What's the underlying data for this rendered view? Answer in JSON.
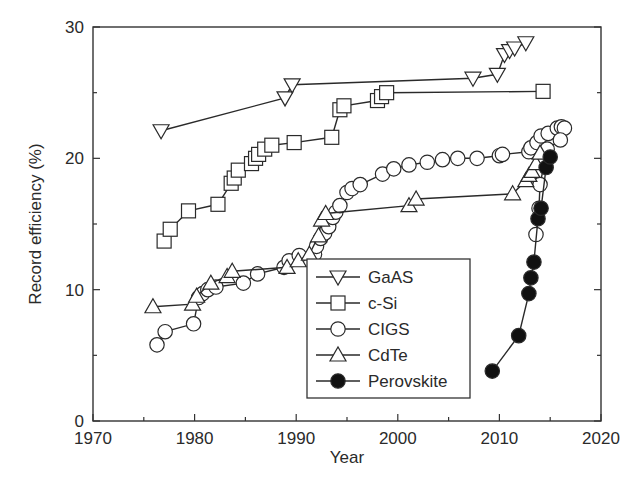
{
  "chart_data": {
    "type": "line",
    "title": "",
    "xlabel": "Year",
    "ylabel": "Record efficiency (%)",
    "xlim": [
      1970,
      2020
    ],
    "ylim": [
      0,
      30
    ],
    "x_ticks": [
      1970,
      1980,
      1990,
      2000,
      2010,
      2020
    ],
    "y_ticks": [
      0,
      10,
      20,
      30
    ],
    "x_minor_ticks": [
      1975,
      1985,
      1995,
      2005,
      2015
    ],
    "y_minor_ticks": [
      5,
      15,
      25
    ],
    "grid": false,
    "legend_position": "lower center (inside plot)",
    "series": [
      {
        "name": "GaAS",
        "marker": "triangle-down",
        "fill": "open",
        "points": [
          [
            1976.7,
            22.1
          ],
          [
            1988.9,
            24.6
          ],
          [
            1989.6,
            25.6
          ],
          [
            2007.4,
            26.1
          ],
          [
            2009.8,
            26.4
          ],
          [
            2010.5,
            27.9
          ],
          [
            2011.0,
            28.2
          ],
          [
            2011.5,
            28.4
          ],
          [
            2012.6,
            28.8
          ]
        ]
      },
      {
        "name": "c-Si",
        "marker": "square",
        "fill": "open",
        "points": [
          [
            1977.0,
            13.7
          ],
          [
            1977.6,
            14.6
          ],
          [
            1979.4,
            16.0
          ],
          [
            1982.3,
            16.5
          ],
          [
            1983.6,
            18.1
          ],
          [
            1983.9,
            18.5
          ],
          [
            1984.3,
            19.1
          ],
          [
            1985.6,
            19.6
          ],
          [
            1986.0,
            20.0
          ],
          [
            1986.3,
            20.3
          ],
          [
            1986.9,
            20.7
          ],
          [
            1987.6,
            21.0
          ],
          [
            1989.8,
            21.2
          ],
          [
            1993.5,
            21.6
          ],
          [
            1994.3,
            23.7
          ],
          [
            1994.7,
            24.0
          ],
          [
            1998.0,
            24.4
          ],
          [
            1998.4,
            24.7
          ],
          [
            1998.9,
            25.0
          ],
          [
            2014.3,
            25.1
          ]
        ]
      },
      {
        "name": "CIGS",
        "marker": "circle",
        "fill": "open",
        "points": [
          [
            1976.3,
            5.8
          ],
          [
            1977.1,
            6.8
          ],
          [
            1979.9,
            7.4
          ],
          [
            1980.4,
            9.4
          ],
          [
            1980.8,
            9.7
          ],
          [
            1981.3,
            10.0
          ],
          [
            1982.1,
            10.2
          ],
          [
            1984.8,
            10.5
          ],
          [
            1986.2,
            11.2
          ],
          [
            1988.8,
            11.7
          ],
          [
            1989.3,
            12.2
          ],
          [
            1990.3,
            12.6
          ],
          [
            1991.8,
            12.7
          ],
          [
            1992.0,
            13.3
          ],
          [
            1992.4,
            13.9
          ],
          [
            1992.8,
            14.3
          ],
          [
            1993.2,
            14.8
          ],
          [
            1993.6,
            15.5
          ],
          [
            1993.9,
            15.9
          ],
          [
            1994.3,
            16.4
          ],
          [
            1995.0,
            17.4
          ],
          [
            1995.5,
            17.7
          ],
          [
            1996.3,
            18.0
          ],
          [
            1998.5,
            18.8
          ],
          [
            1999.6,
            19.2
          ],
          [
            2001.1,
            19.5
          ],
          [
            2002.9,
            19.7
          ],
          [
            2004.4,
            19.9
          ],
          [
            2005.9,
            20.0
          ],
          [
            2007.8,
            20.0
          ],
          [
            2010.0,
            20.2
          ],
          [
            2010.3,
            20.3
          ],
          [
            2012.9,
            20.5
          ],
          [
            2013.1,
            20.8
          ],
          [
            2013.7,
            21.2
          ],
          [
            2014.1,
            21.7
          ],
          [
            2014.8,
            21.9
          ],
          [
            2015.7,
            22.3
          ],
          [
            2016.1,
            22.4
          ],
          [
            2016.4,
            22.3
          ],
          [
            2016.0,
            21.4
          ],
          [
            2014.7,
            20.7
          ],
          [
            2014.0,
            18.0
          ],
          [
            2013.9,
            16.2
          ],
          [
            2013.6,
            14.2
          ]
        ]
      },
      {
        "name": "CdTe",
        "marker": "triangle-up",
        "fill": "open",
        "points": [
          [
            1975.9,
            8.7
          ],
          [
            1979.8,
            8.9
          ],
          [
            1980.2,
            9.5
          ],
          [
            1981.6,
            10.5
          ],
          [
            1983.2,
            11.0
          ],
          [
            1983.7,
            11.4
          ],
          [
            1989.1,
            11.7
          ],
          [
            1990.2,
            12.2
          ],
          [
            1991.3,
            12.7
          ],
          [
            1992.2,
            14.1
          ],
          [
            1992.5,
            15.3
          ],
          [
            1992.9,
            15.8
          ],
          [
            2001.1,
            16.4
          ],
          [
            2001.8,
            16.9
          ],
          [
            2011.3,
            17.3
          ],
          [
            2012.6,
            18.3
          ],
          [
            2012.9,
            18.7
          ],
          [
            2013.2,
            19.0
          ],
          [
            2013.6,
            19.6
          ],
          [
            2014.0,
            20.4
          ]
        ]
      },
      {
        "name": "Perovskite",
        "marker": "circle",
        "fill": "filled",
        "points": [
          [
            2009.3,
            3.8
          ],
          [
            2011.9,
            6.5
          ],
          [
            2012.9,
            9.7
          ],
          [
            2013.1,
            10.9
          ],
          [
            2013.4,
            12.1
          ],
          [
            2013.8,
            15.4
          ],
          [
            2014.1,
            16.2
          ],
          [
            2014.6,
            19.3
          ],
          [
            2015.0,
            20.1
          ]
        ]
      }
    ]
  }
}
